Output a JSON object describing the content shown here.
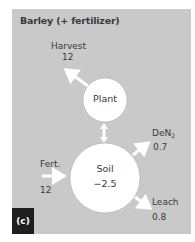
{
  "title": "Barley (+ fertilizer)",
  "panel_tag": "(c)",
  "colors": {
    "panel_bg": "#c9c9c9",
    "node_fill": "#ffffff",
    "arrow": "#ffffff",
    "text": "#3a3a3a",
    "tag_bg": "#1f1f1f"
  },
  "nodes": {
    "plant": {
      "label": "Plant"
    },
    "soil": {
      "label": "Soil",
      "value": "−2.5"
    }
  },
  "flows": {
    "harvest": {
      "label": "Harvest",
      "value": "12"
    },
    "denitrification": {
      "label": "DeN",
      "label_sub": "2",
      "value": "0.7"
    },
    "fertilizer": {
      "label": "Fert.",
      "value": "12"
    },
    "leach": {
      "label": "Leach",
      "value": "0.8"
    }
  }
}
